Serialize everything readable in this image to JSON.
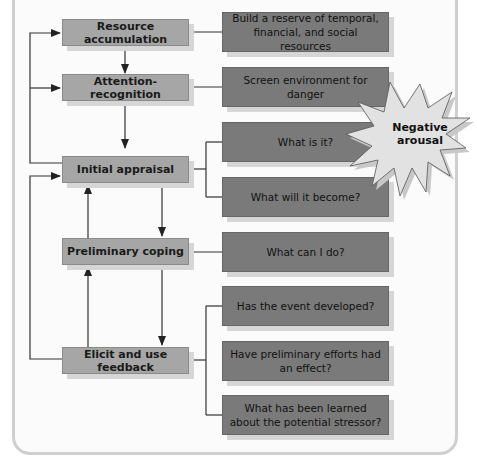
{
  "diagram": {
    "left_nodes": [
      {
        "id": "resource-accumulation",
        "label": "Resource accumulation"
      },
      {
        "id": "attention-recognition",
        "label": "Attention-recognition"
      },
      {
        "id": "initial-appraisal",
        "label": "Initial appraisal"
      },
      {
        "id": "preliminary-coping",
        "label": "Preliminary coping"
      },
      {
        "id": "elicit-feedback",
        "label": "Elicit and use feedback"
      }
    ],
    "right_nodes": [
      {
        "id": "build-reserve",
        "label": "Build a reserve of temporal, financial, and social resources"
      },
      {
        "id": "screen-environment",
        "label": "Screen environment for danger"
      },
      {
        "id": "what-is-it",
        "label": "What is it?"
      },
      {
        "id": "what-will-it-become",
        "label": "What will it become?"
      },
      {
        "id": "what-can-i-do",
        "label": "What can I do?"
      },
      {
        "id": "event-developed",
        "label": "Has the event developed?"
      },
      {
        "id": "preliminary-efforts",
        "label": "Have preliminary efforts had an effect?"
      },
      {
        "id": "learned-stressor",
        "label": "What has been learned about the potential stressor?"
      }
    ],
    "callout": {
      "label": "Negative arousal"
    },
    "colors": {
      "left_box": "#a6a6a6",
      "right_box": "#7a7a7a",
      "burst": "#dcdcdc",
      "line": "#222222"
    }
  }
}
